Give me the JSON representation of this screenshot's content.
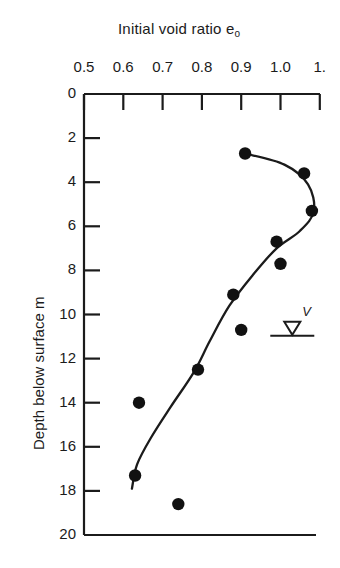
{
  "chart_data": {
    "type": "scatter",
    "title": "Initial void ratio e",
    "title_subscript": "o",
    "xlabel": "Initial void ratio e_o",
    "ylabel": "Depth below surface m",
    "xlim": [
      0.5,
      1.1
    ],
    "ylim": [
      0,
      20
    ],
    "y_inverted": true,
    "grid": false,
    "legend": null,
    "xticks": [
      0.5,
      0.6,
      0.7,
      0.8,
      0.9,
      1.0,
      1.1
    ],
    "xtick_labels": [
      "0.5",
      "0.6",
      "0.7",
      "0.8",
      "0.9",
      "1.0",
      "1."
    ],
    "yticks": [
      0,
      2,
      4,
      6,
      8,
      10,
      12,
      14,
      16,
      18,
      20
    ],
    "ytick_labels": [
      "0",
      "2",
      "4",
      "6",
      "8",
      "10",
      "12",
      "14",
      "16",
      "18",
      "20"
    ],
    "x": [
      0.91,
      1.06,
      1.08,
      0.99,
      1.0,
      0.88,
      0.9,
      0.79,
      0.64,
      0.63,
      0.74
    ],
    "y": [
      2.7,
      3.6,
      5.3,
      6.7,
      7.7,
      9.1,
      10.7,
      12.5,
      14.0,
      17.3,
      18.6
    ],
    "points": [
      {
        "e0": 0.91,
        "depth": 2.7
      },
      {
        "e0": 1.06,
        "depth": 3.6
      },
      {
        "e0": 1.08,
        "depth": 5.3
      },
      {
        "e0": 0.99,
        "depth": 6.7
      },
      {
        "e0": 1.0,
        "depth": 7.7
      },
      {
        "e0": 0.88,
        "depth": 9.1
      },
      {
        "e0": 0.9,
        "depth": 10.7
      },
      {
        "e0": 0.79,
        "depth": 12.5
      },
      {
        "e0": 0.64,
        "depth": 14.0
      },
      {
        "e0": 0.63,
        "depth": 17.3
      },
      {
        "e0": 0.74,
        "depth": 18.6
      }
    ],
    "fit_curve": [
      {
        "e0": 0.91,
        "depth": 2.7
      },
      {
        "e0": 1.01,
        "depth": 3.2
      },
      {
        "e0": 1.07,
        "depth": 4.1
      },
      {
        "e0": 1.085,
        "depth": 5.3
      },
      {
        "e0": 1.05,
        "depth": 6.2
      },
      {
        "e0": 0.99,
        "depth": 7.0
      },
      {
        "e0": 0.93,
        "depth": 8.2
      },
      {
        "e0": 0.87,
        "depth": 9.6
      },
      {
        "e0": 0.82,
        "depth": 11.2
      },
      {
        "e0": 0.78,
        "depth": 12.6
      },
      {
        "e0": 0.72,
        "depth": 14.2
      },
      {
        "e0": 0.67,
        "depth": 15.6
      },
      {
        "e0": 0.635,
        "depth": 16.8
      },
      {
        "e0": 0.622,
        "depth": 17.9
      }
    ],
    "annotations": [
      {
        "name": "water-table",
        "label": "V",
        "e0": 1.03,
        "depth": 10.6
      }
    ],
    "marker_color": "#111111",
    "line_color": "#1b1b1b",
    "axis_color": "#1b1b1b"
  }
}
